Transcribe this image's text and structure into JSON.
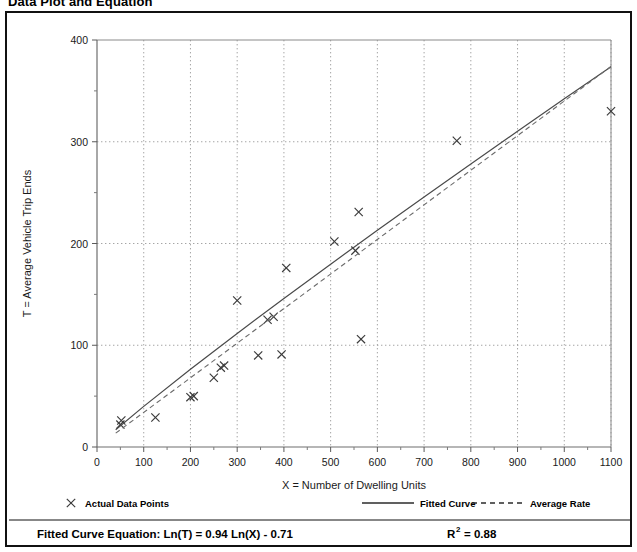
{
  "page": {
    "title": "Data Plot and Equation"
  },
  "chart_data": {
    "type": "scatter",
    "title": "Data Plot and Equation",
    "xlabel": "X = Number of Dwelling Units",
    "ylabel": "T = Average Vehicle Trip Ends",
    "xlim": [
      0,
      1100
    ],
    "ylim": [
      0,
      400
    ],
    "xticks": [
      0,
      100,
      200,
      300,
      400,
      500,
      600,
      700,
      800,
      900,
      1000,
      1100
    ],
    "xtick_labels": [
      "0",
      "100",
      "200",
      "300",
      "400",
      "500",
      "600",
      "700",
      "800",
      "900",
      "1000",
      "1100"
    ],
    "yticks": [
      0,
      100,
      200,
      300,
      400
    ],
    "ytick_labels": [
      "0",
      "100",
      "200",
      "300",
      "400"
    ],
    "y_minor_ticks": [
      50,
      150,
      250,
      350
    ],
    "grid": true,
    "grid_style": "dotted",
    "legend_position": "below-axes",
    "series": [
      {
        "name": "Actual Data Points",
        "type": "scatter",
        "marker": "x",
        "color": "#3a3a3a",
        "points": [
          {
            "x": 50,
            "y": 22
          },
          {
            "x": 52,
            "y": 26
          },
          {
            "x": 125,
            "y": 29
          },
          {
            "x": 200,
            "y": 49
          },
          {
            "x": 207,
            "y": 50
          },
          {
            "x": 250,
            "y": 68
          },
          {
            "x": 265,
            "y": 78
          },
          {
            "x": 272,
            "y": 80
          },
          {
            "x": 300,
            "y": 144
          },
          {
            "x": 345,
            "y": 90
          },
          {
            "x": 365,
            "y": 125
          },
          {
            "x": 378,
            "y": 128
          },
          {
            "x": 395,
            "y": 91
          },
          {
            "x": 405,
            "y": 176
          },
          {
            "x": 508,
            "y": 202
          },
          {
            "x": 553,
            "y": 193
          },
          {
            "x": 560,
            "y": 231
          },
          {
            "x": 565,
            "y": 106
          },
          {
            "x": 770,
            "y": 301
          },
          {
            "x": 1100,
            "y": 330
          }
        ]
      },
      {
        "name": "Fitted Curve",
        "type": "line",
        "style": "solid",
        "color": "#4a4a4a",
        "equation": "Ln(T) = 0.94 Ln(X) - 0.71",
        "coef_a": 0.94,
        "coef_b": -0.71,
        "points": [
          {
            "x": 40,
            "y": 17.0
          },
          {
            "x": 100,
            "y": 39.9
          },
          {
            "x": 200,
            "y": 76.5
          },
          {
            "x": 300,
            "y": 111.6
          },
          {
            "x": 400,
            "y": 146.0
          },
          {
            "x": 500,
            "y": 179.7
          },
          {
            "x": 600,
            "y": 213.0
          },
          {
            "x": 700,
            "y": 245.7
          },
          {
            "x": 800,
            "y": 278.2
          },
          {
            "x": 900,
            "y": 310.3
          },
          {
            "x": 1000,
            "y": 342.2
          },
          {
            "x": 1100,
            "y": 373.8
          }
        ]
      },
      {
        "name": "Average Rate",
        "type": "line",
        "style": "dashed",
        "color": "#6b6b6b",
        "points": [
          {
            "x": 40,
            "y": 13.6
          },
          {
            "x": 1100,
            "y": 374.0
          }
        ]
      }
    ],
    "annotations": {
      "equation_label": "Fitted Curve Equation:",
      "equation_body": "Ln(T) = 0.94 Ln(X) - 0.71",
      "r_squared_base": "R",
      "r_squared_exp": "2",
      "r_squared_value": "= 0.88",
      "r_squared": 0.88
    }
  },
  "legend": {
    "items": [
      {
        "label": "Actual Data Points",
        "symbol": "x-marker"
      },
      {
        "label": "Fitted Curve",
        "symbol": "solid-line"
      },
      {
        "label": "Average Rate",
        "symbol": "dashed-line"
      }
    ]
  }
}
